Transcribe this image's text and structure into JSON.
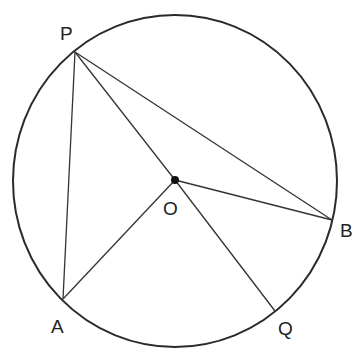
{
  "diagram": {
    "type": "circle-geometry",
    "circle": {
      "center": "O",
      "cx": 175,
      "cy": 181,
      "rx": 162,
      "ry": 166
    },
    "points": [
      {
        "name": "P",
        "x": 75,
        "y": 52,
        "label": "P",
        "lx": 60,
        "ly": 40
      },
      {
        "name": "O",
        "x": 175,
        "y": 180,
        "label": "O",
        "lx": 163,
        "ly": 215
      },
      {
        "name": "B",
        "x": 332,
        "y": 220,
        "label": "B",
        "lx": 340,
        "ly": 237
      },
      {
        "name": "A",
        "x": 63,
        "y": 299,
        "label": "A",
        "lx": 51,
        "ly": 333
      },
      {
        "name": "Q",
        "x": 275,
        "y": 311,
        "label": "Q",
        "lx": 278,
        "ly": 335
      }
    ],
    "segments": [
      [
        "P",
        "A"
      ],
      [
        "P",
        "O"
      ],
      [
        "P",
        "B"
      ],
      [
        "O",
        "B"
      ],
      [
        "O",
        "A"
      ],
      [
        "O",
        "Q"
      ]
    ]
  }
}
